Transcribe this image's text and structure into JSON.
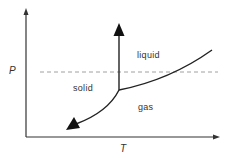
{
  "diagram": {
    "type": "phase-diagram",
    "axes": {
      "x_label": "T",
      "y_label": "P"
    },
    "regions": {
      "solid": "solid",
      "liquid": "liquid",
      "gas": "gas"
    },
    "lines": [
      "solid-liquid boundary (vertical, arrow up)",
      "liquid-gas boundary (curve)",
      "solid-gas boundary (curve, arrow down-left)",
      "dashed horizontal pressure line"
    ],
    "colors": {
      "line": "#222222",
      "dashed": "#888888",
      "text": "#333333"
    }
  }
}
